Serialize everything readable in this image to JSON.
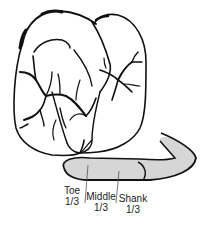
{
  "diagram": {
    "colors": {
      "outline": "#111111",
      "blade_fill": "#d6d6d6",
      "background": "#ffffff",
      "label_text": "#222222"
    },
    "segments": [
      {
        "name": "Toe",
        "fraction": "1/3"
      },
      {
        "name": "Middle",
        "fraction": "1/3"
      },
      {
        "name": "Shank",
        "fraction": "1/3"
      }
    ]
  }
}
